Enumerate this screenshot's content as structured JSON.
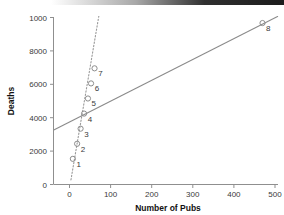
{
  "chart_data": {
    "type": "scatter",
    "title": "",
    "xlabel": "Number of Pubs",
    "ylabel": "Deaths",
    "xlim": [
      -40,
      540
    ],
    "ylim": [
      -700,
      10600
    ],
    "xticks": [
      0,
      100,
      200,
      300,
      400,
      500
    ],
    "xticklabels": [
      "0",
      "100",
      "200",
      "300",
      "400",
      "500"
    ],
    "yticks": [
      0,
      2000,
      4000,
      6000,
      8000,
      10000
    ],
    "yticklabels": [
      "0",
      "2000",
      "4000",
      "6000",
      "8000",
      "1000"
    ],
    "grid": false,
    "legend": null,
    "marker": "open-circle",
    "points": [
      {
        "label": "1",
        "x": 10,
        "y": 1000
      },
      {
        "label": "2",
        "x": 21,
        "y": 2000
      },
      {
        "label": "3",
        "x": 30,
        "y": 3000
      },
      {
        "label": "4",
        "x": 39,
        "y": 4000
      },
      {
        "label": "5",
        "x": 49,
        "y": 5000
      },
      {
        "label": "6",
        "x": 57,
        "y": 6000
      },
      {
        "label": "7",
        "x": 66,
        "y": 7000
      },
      {
        "label": "8",
        "x": 500,
        "y": 10000
      }
    ],
    "lines": [
      {
        "name": "regression-all-points",
        "style": "solid",
        "x": [
          -40,
          540
        ],
        "y": [
          2900,
          10450
        ]
      },
      {
        "name": "fit-excluding-outlier",
        "style": "dotted",
        "x": [
          5,
          78
        ],
        "y": [
          -400,
          10600
        ]
      }
    ],
    "colors": {
      "marker": "#8d8d8d",
      "solid_line": "#8a8a8a",
      "dotted_line": "#9a9a9a",
      "axis": "#8f8f8f",
      "tick_label": "#3a3a3a",
      "axis_title": "#111111",
      "background": "#ffffff"
    }
  }
}
